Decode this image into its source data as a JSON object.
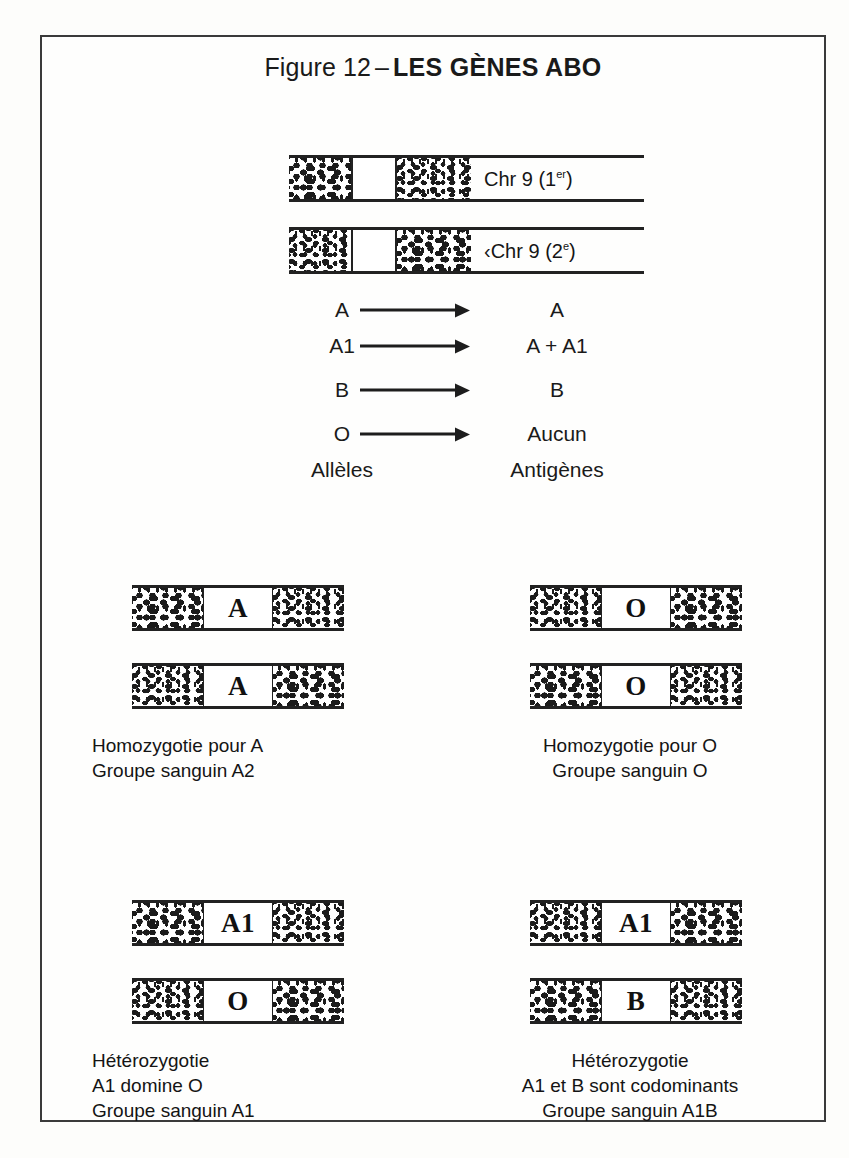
{
  "figure": {
    "number_label": "Figure 12",
    "dash": "–",
    "name": "LES GÈNES ABO"
  },
  "top_chromosomes": [
    {
      "label_text": "Chr 9 (1",
      "label_sup": "er",
      "label_tail": ")"
    },
    {
      "label_prefix": "‹",
      "label_text": "Chr 9 (2",
      "label_sup": "e",
      "label_tail": ")"
    }
  ],
  "mapping": {
    "rows": [
      {
        "allele": "A",
        "antigen": "A"
      },
      {
        "allele": "A1",
        "antigen": "A + A1"
      },
      {
        "allele": "B",
        "antigen": "B"
      },
      {
        "allele": "O",
        "antigen": "Aucun"
      }
    ],
    "header_left": "Allèles",
    "header_right": "Antigènes"
  },
  "panels": [
    {
      "id": "top-left",
      "alleles": [
        "A",
        "A"
      ],
      "caption": [
        "Homozygotie pour A",
        "Groupe sanguin A2"
      ]
    },
    {
      "id": "top-right",
      "alleles": [
        "O",
        "O"
      ],
      "caption": [
        "Homozygotie pour O",
        "Groupe sanguin O"
      ]
    },
    {
      "id": "bottom-left",
      "alleles": [
        "A1",
        "O"
      ],
      "caption": [
        "Hétérozygotie",
        "A1 domine O",
        "Groupe sanguin A1"
      ]
    },
    {
      "id": "bottom-right",
      "alleles": [
        "A1",
        "B"
      ],
      "caption": [
        "Hétérozygotie",
        "A1 et B sont codominants",
        "Groupe sanguin A1B"
      ]
    }
  ],
  "colors": {
    "ink": "#1a1a1a",
    "frame": "#3a3a3a",
    "paper": "#fdfdfb"
  }
}
